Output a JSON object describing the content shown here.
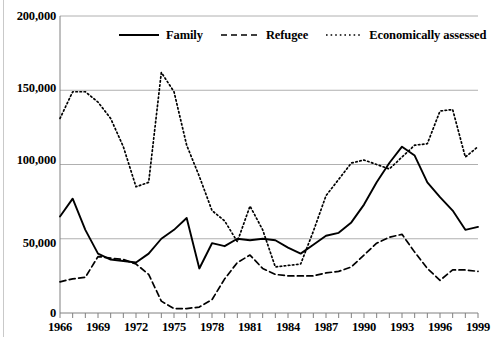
{
  "legend": {
    "position": "top-center",
    "items": [
      {
        "label": "Family",
        "style": "solid",
        "icon": "solid-line-icon"
      },
      {
        "label": "Refugee",
        "style": "dashed",
        "icon": "dashed-line-icon"
      },
      {
        "label": "Economically assessed",
        "style": "dotted",
        "icon": "dotted-line-icon"
      }
    ]
  },
  "axes": {
    "y_ticks": [
      "200,000",
      "150,000",
      "100,000",
      "50,000",
      "0"
    ],
    "y_values": [
      200000,
      150000,
      100000,
      50000,
      0
    ],
    "x_ticks": [
      "1966",
      "1969",
      "1972",
      "1975",
      "1978",
      "1981",
      "1984",
      "1987",
      "1990",
      "1993",
      "1996",
      "1999"
    ],
    "x_tick_values": [
      1966,
      1969,
      1972,
      1975,
      1978,
      1981,
      1984,
      1987,
      1990,
      1993,
      1996,
      1999
    ]
  },
  "colors": {
    "line": "#000000",
    "grid": "#b0b0b0",
    "axis": "#808080",
    "background": "#ffffff"
  },
  "chart_data": {
    "type": "line",
    "title": "",
    "subtitle": "",
    "xlabel": "",
    "ylabel": "",
    "xlim": [
      1966,
      1999
    ],
    "ylim": [
      0,
      200000
    ],
    "grid": true,
    "ytick_step": 50000,
    "xtick_step": 3,
    "xtick_minor_step": 1,
    "legend_position": "top-center",
    "x": [
      1966,
      1967,
      1968,
      1969,
      1970,
      1971,
      1972,
      1973,
      1974,
      1975,
      1976,
      1977,
      1978,
      1979,
      1980,
      1981,
      1982,
      1983,
      1984,
      1985,
      1986,
      1987,
      1988,
      1989,
      1990,
      1991,
      1992,
      1993,
      1994,
      1995,
      1996,
      1997,
      1998,
      1999
    ],
    "series": [
      {
        "name": "Family",
        "style": "solid",
        "values": [
          65000,
          77000,
          56000,
          40000,
          36000,
          35000,
          34000,
          40000,
          50000,
          56000,
          64000,
          30000,
          47000,
          45000,
          50000,
          49000,
          50000,
          49000,
          44000,
          40000,
          46000,
          52000,
          54000,
          61000,
          73000,
          88000,
          101000,
          112000,
          106000,
          88000,
          78000,
          69000,
          56000,
          58000
        ]
      },
      {
        "name": "Refugee",
        "style": "dashed",
        "values": [
          21000,
          23000,
          24000,
          38000,
          37000,
          36000,
          33000,
          26000,
          8000,
          3000,
          3000,
          4000,
          9000,
          23000,
          34000,
          39000,
          30000,
          26000,
          25000,
          25000,
          25000,
          27000,
          28000,
          31000,
          39000,
          47000,
          51000,
          53000,
          41000,
          30000,
          22000,
          29000,
          29000,
          28000
        ]
      },
      {
        "name": "Economically assessed",
        "style": "dotted",
        "values": [
          131000,
          149000,
          149000,
          142000,
          131000,
          112000,
          85000,
          88000,
          162000,
          149000,
          113000,
          92000,
          69000,
          62000,
          48000,
          72000,
          56000,
          31000,
          32000,
          33000,
          55000,
          79000,
          90000,
          101000,
          103000,
          100000,
          97000,
          105000,
          113000,
          114000,
          136000,
          137000,
          105000,
          112000
        ]
      }
    ]
  }
}
